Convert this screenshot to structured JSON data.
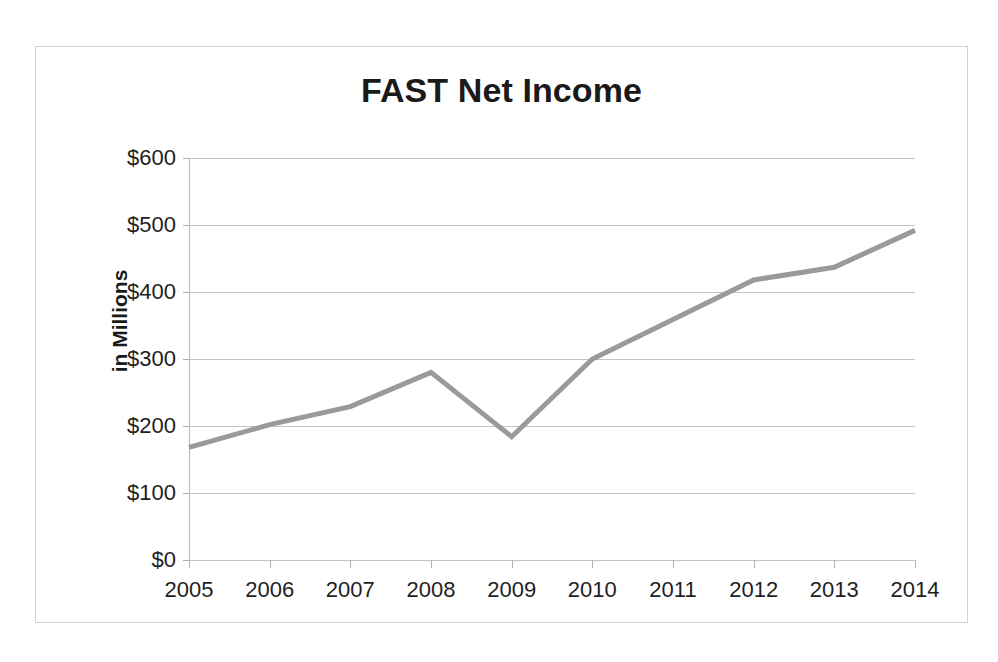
{
  "chart_data": {
    "type": "line",
    "title": "FAST Net Income",
    "xlabel": "",
    "ylabel": "in Millions",
    "categories": [
      "2005",
      "2006",
      "2007",
      "2008",
      "2009",
      "2010",
      "2011",
      "2012",
      "2013",
      "2014"
    ],
    "values": [
      168,
      202,
      229,
      280,
      184,
      300,
      359,
      418,
      437,
      492
    ],
    "series": [
      {
        "name": "FAST Net Income",
        "values": [
          168,
          202,
          229,
          280,
          184,
          300,
          359,
          418,
          437,
          492
        ]
      }
    ],
    "ylim": [
      0,
      600
    ],
    "ytick_values": [
      600,
      500,
      400,
      300,
      200,
      100,
      0
    ],
    "ytick_labels": [
      "$600",
      "$500",
      "$400",
      "$300",
      "$200",
      "$100",
      "$0"
    ],
    "grid": true,
    "legend": false,
    "legend_position": "none",
    "line_color": "#9a9a9a",
    "gridline_color": "#c4c4c4",
    "axis_color": "#b8b8b8",
    "text_color": "#1f1f1f",
    "background_color": "#ffffff",
    "border_color": "#d2d2d2"
  }
}
